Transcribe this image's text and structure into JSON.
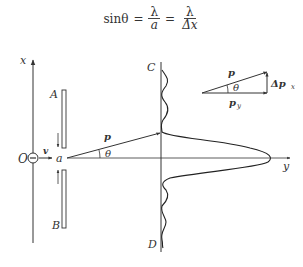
{
  "formula": {
    "lhs": "sinθ",
    "eq": "=",
    "frac1": {
      "num": "λ",
      "den": "a"
    },
    "frac2": {
      "num": "λ",
      "den": "Δx"
    }
  },
  "labels": {
    "x_axis": "x",
    "y_axis": "y",
    "origin": "O",
    "velocity": "v",
    "slit_width": "a",
    "plate_top": "A",
    "plate_bottom": "B",
    "screen_top": "C",
    "screen_bottom": "D",
    "momentum": "p",
    "theta": "θ",
    "vec_p": "p",
    "vec_py": "p",
    "vec_py_sub": "y",
    "vec_theta": "θ",
    "vec_dpx": "Δp",
    "vec_dpx_sub": "x"
  },
  "colors": {
    "line": "#333333",
    "background": "#ffffff"
  }
}
